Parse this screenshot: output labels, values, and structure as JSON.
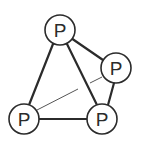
{
  "diagram": {
    "title": "",
    "atoms": [
      {
        "id": "top",
        "label": "P"
      },
      {
        "id": "right",
        "label": "P"
      },
      {
        "id": "bottom-left",
        "label": "P"
      },
      {
        "id": "bottom-right",
        "label": "P"
      }
    ],
    "bonds": [
      {
        "from": "top",
        "to": "right",
        "style": "solid"
      },
      {
        "from": "top",
        "to": "bottom-left",
        "style": "solid"
      },
      {
        "from": "top",
        "to": "bottom-right",
        "style": "solid"
      },
      {
        "from": "right",
        "to": "bottom-right",
        "style": "solid"
      },
      {
        "from": "bottom-left",
        "to": "bottom-right",
        "style": "solid"
      },
      {
        "from": "bottom-left",
        "to": "right",
        "style": "back-thin"
      }
    ]
  }
}
